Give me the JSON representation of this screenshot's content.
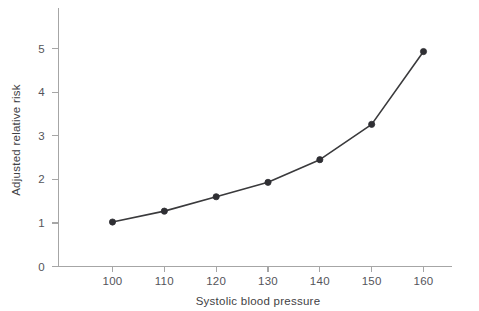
{
  "chart_data": {
    "type": "line",
    "title": "",
    "subtitle": "",
    "xlabel": "Systolic blood pressure",
    "ylabel": "Adjusted relative risk",
    "x": [
      100,
      110,
      120,
      130,
      140,
      150,
      160
    ],
    "values": [
      1.02,
      1.27,
      1.6,
      1.93,
      2.45,
      3.26,
      4.93
    ],
    "series": [
      {
        "name": "Adjusted relative risk",
        "values": [
          1.02,
          1.27,
          1.6,
          1.93,
          2.45,
          3.26,
          4.93
        ]
      }
    ],
    "xtick_labels": [
      "100",
      "110",
      "120",
      "130",
      "140",
      "150",
      "160"
    ],
    "ytick_labels": [
      "0",
      "1",
      "2",
      "3",
      "4",
      "5"
    ],
    "ytick_values": [
      0,
      1,
      2,
      3,
      4,
      5
    ],
    "xlim": [
      95,
      165
    ],
    "ylim": [
      0,
      5.95
    ],
    "grid": false,
    "legend": false,
    "legend_position": "none",
    "marker": "filled-circle",
    "annotations": []
  },
  "style": {
    "background_color": "#ffffff",
    "line_color": "#3a3a3c",
    "marker_color": "#2f2f33",
    "axis_color": "#a6a6a6",
    "text_color": "#54545a"
  },
  "figure": {
    "caption": ""
  }
}
